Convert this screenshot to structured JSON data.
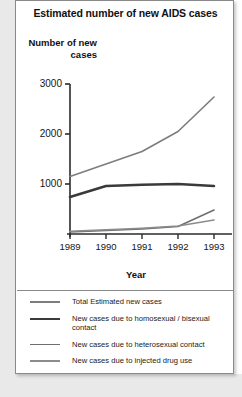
{
  "chart_data": {
    "type": "line",
    "title": "Estimated number of new AIDS cases",
    "xlabel": "Year",
    "ylabel": "Number of new cases",
    "x": [
      "1989",
      "1990",
      "1991",
      "1992",
      "1993"
    ],
    "xticklabels": [
      "1989",
      "1990",
      "1991",
      "1992",
      "1993"
    ],
    "yticklabels": [
      "3000",
      "2000",
      "1000"
    ],
    "yticks": [
      3000,
      2000,
      1000
    ],
    "ylim": [
      0,
      3200
    ],
    "grid": false,
    "legend_position": "bottom",
    "series": [
      {
        "name": "Total Estimated new cases",
        "values": [
          1150,
          1400,
          1650,
          2050,
          2740
        ],
        "color": "#7d7d7d",
        "width": 1.6
      },
      {
        "name": "New cases due to homosexual / bisexual contact",
        "values": [
          740,
          960,
          985,
          1000,
          960
        ],
        "color": "#3a3a3a",
        "width": 2.6
      },
      {
        "name": "New cases due to heterosexual contact",
        "values": [
          40,
          70,
          100,
          150,
          480
        ],
        "color": "#6f6f6f",
        "width": 1.6
      },
      {
        "name": "New cases due to injected drug use",
        "values": [
          55,
          85,
          115,
          160,
          280
        ],
        "color": "#8c8c8c",
        "width": 1.6
      }
    ]
  },
  "legend": {
    "entries": [
      {
        "label": "Total Estimated new cases"
      },
      {
        "label": "New cases due to homosexual / bisexual contact"
      },
      {
        "label": "New cases due to heterosexual contact"
      },
      {
        "label": "New cases due to injected drug use"
      }
    ]
  }
}
